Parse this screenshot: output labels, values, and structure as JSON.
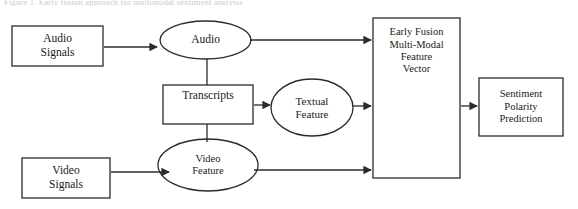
{
  "figure": {
    "title_fragment_cutoff": "Figure 1. Early fusion approach for multimodal sentiment analysis",
    "background_color": "#ffffff",
    "stroke_color": "#2b2b2b",
    "text_color": "#1a1a1a"
  },
  "nodes": {
    "audio_signals": {
      "label": "Audio\nSignals",
      "shape": "rectangle",
      "x": 12,
      "y": 26,
      "w": 91,
      "h": 40,
      "font_size": 11.5
    },
    "audio": {
      "label": "Audio",
      "shape": "ellipse",
      "x": 160,
      "y": 21,
      "w": 91,
      "h": 38,
      "font_size": 11.5
    },
    "transcripts": {
      "label": "Transcripts",
      "shape": "rectangle",
      "x": 163,
      "y": 85,
      "w": 90,
      "h": 39,
      "font_size": 11.5,
      "text_offset_y": -9
    },
    "textual_feature": {
      "label": "Textual\nFeature",
      "shape": "ellipse",
      "x": 271,
      "y": 79,
      "w": 82,
      "h": 57,
      "font_size": 11
    },
    "video_signals": {
      "label": "Video\nSignals",
      "shape": "rectangle",
      "x": 22,
      "y": 158,
      "w": 88,
      "h": 40,
      "font_size": 11.5
    },
    "video_feature": {
      "label": "Video\nFeature",
      "shape": "ellipse",
      "x": 158,
      "y": 139,
      "w": 100,
      "h": 52,
      "font_size": 10.5
    },
    "early_fusion": {
      "label": "Early Fusion\nMulti-Modal\nFeature\nVector",
      "shape": "rectangle",
      "x": 373,
      "y": 18,
      "w": 87,
      "h": 160,
      "font_size": 10.5,
      "text_offset_y": -47
    },
    "sentiment_prediction": {
      "label": "Sentiment\nPolarity\nPrediction",
      "shape": "rectangle",
      "x": 479,
      "y": 78,
      "w": 84,
      "h": 58,
      "font_size": 10.5
    }
  },
  "edges": [
    {
      "name": "audio-signals-to-audio",
      "from": "audio_signals",
      "to": "audio",
      "type": "arrow",
      "path": "M 104,47 L 157,47",
      "arrow_at": [
        157,
        47
      ]
    },
    {
      "name": "audio-to-transcripts",
      "from": "audio",
      "to": "transcripts",
      "type": "line",
      "path": "M 207,59 L 207,85",
      "arrow_at": null
    },
    {
      "name": "audio-to-early-fusion",
      "from": "audio",
      "to": "early_fusion",
      "type": "arrow",
      "path": "M 250,40 L 371,40",
      "arrow_at": [
        371,
        40
      ]
    },
    {
      "name": "transcripts-to-textual-feature",
      "from": "transcripts",
      "to": "textual_feature",
      "type": "arrow",
      "path": "M 254,105 L 270,105",
      "arrow_at": [
        270,
        105
      ]
    },
    {
      "name": "transcripts-to-video-feature",
      "from": "transcripts",
      "to": "video_feature",
      "type": "line",
      "path": "M 207,124 L 207,142",
      "arrow_at": null
    },
    {
      "name": "textual-feature-to-early-fusion",
      "from": "textual_feature",
      "to": "early_fusion",
      "type": "arrow",
      "path": "M 353,106 L 371,106",
      "arrow_at": [
        371,
        106
      ]
    },
    {
      "name": "video-signals-to-video-feature",
      "from": "video_signals",
      "to": "video_feature",
      "type": "arrow",
      "path": "M 111,172 L 169,172",
      "arrow_at": [
        169,
        172
      ]
    },
    {
      "name": "video-feature-to-early-fusion",
      "from": "video_feature",
      "to": "early_fusion",
      "type": "arrow",
      "path": "M 254,170 L 371,170",
      "arrow_at": [
        371,
        170
      ]
    },
    {
      "name": "early-fusion-to-sentiment-prediction",
      "from": "early_fusion",
      "to": "sentiment_prediction",
      "type": "arrow",
      "path": "M 461,106 L 477,106",
      "arrow_at": [
        477,
        106
      ]
    }
  ]
}
